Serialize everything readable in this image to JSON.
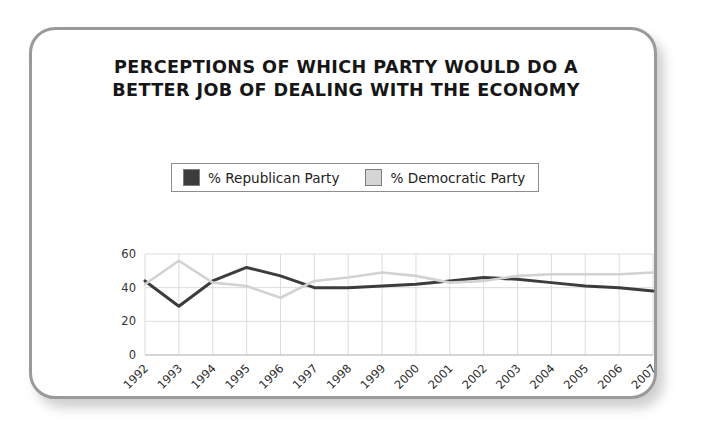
{
  "card": {
    "border_color": "#9a9a9a"
  },
  "title": {
    "line1": "PERCEPTIONS OF WHICH PARTY WOULD DO A",
    "line2": "BETTER JOB OF DEALING WITH THE ECONOMY"
  },
  "legend": {
    "entries": [
      {
        "label": "% Republican Party",
        "color": "#3c3c3c"
      },
      {
        "label": "% Democratic Party",
        "color": "#d5d5d5"
      }
    ]
  },
  "chart_data": {
    "type": "line",
    "title": "PERCEPTIONS OF WHICH PARTY WOULD DO A BETTER JOB OF DEALING WITH THE ECONOMY",
    "xlabel": "",
    "ylabel": "",
    "ylim": [
      0,
      60
    ],
    "yticks": [
      0,
      20,
      40,
      60
    ],
    "grid": true,
    "legend_position": "top",
    "categories": [
      "1992",
      "1993",
      "1994",
      "1995",
      "1996",
      "1997",
      "1998",
      "1999",
      "2000",
      "2001",
      "2002",
      "2003",
      "2004",
      "2005",
      "2006",
      "2007"
    ],
    "series": [
      {
        "name": "% Republican Party",
        "color": "#3c3c3c",
        "values": [
          44,
          29,
          44,
          52,
          47,
          40,
          40,
          41,
          42,
          44,
          46,
          45,
          43,
          41,
          40,
          38
        ]
      },
      {
        "name": "% Democratic Party",
        "color": "#d2d2d2",
        "values": [
          42,
          56,
          43,
          41,
          34,
          44,
          46,
          49,
          47,
          43,
          44,
          47,
          48,
          48,
          48,
          49
        ]
      }
    ]
  }
}
